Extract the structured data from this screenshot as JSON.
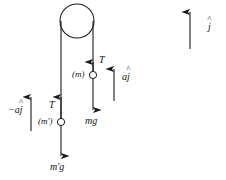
{
  "diagram": {
    "stroke_color": "#1a1a1a",
    "text_color": "#111111",
    "background": "#ffffff",
    "pulley": {
      "name": "pulley-wheel",
      "cx": 77,
      "cy": 21,
      "r": 17
    },
    "ropes": [
      {
        "name": "left-rope",
        "x": 61,
        "y_top": 21,
        "y_bottom": 122
      },
      {
        "name": "right-rope",
        "x": 93,
        "y_top": 21,
        "y_bottom": 75
      }
    ],
    "masses": [
      {
        "name": "mass-node-m-prime",
        "label": "(m')",
        "cx": 61,
        "cy": 122,
        "r": 4
      },
      {
        "name": "mass-node-m",
        "label": "(m)",
        "cx": 93,
        "cy": 75,
        "r": 4
      }
    ],
    "vectors": [
      {
        "name": "tension-left",
        "label": "T",
        "direction": "up",
        "x": 61,
        "y_tail": 122,
        "y_head": 96
      },
      {
        "name": "weight-left",
        "label": "m'g",
        "direction": "down",
        "x": 61,
        "y_tail": 126,
        "y_head": 157
      },
      {
        "name": "tension-right",
        "label": "T",
        "direction": "up",
        "x": 93,
        "y_tail": 75,
        "y_head": 61
      },
      {
        "name": "weight-right",
        "label": "mg",
        "direction": "down",
        "x": 93,
        "y_tail": 79,
        "y_head": 111
      },
      {
        "name": "acceleration-left",
        "label_prefix": "−a",
        "label_hat": "j",
        "direction": "up",
        "x": 31,
        "y_tail": 131,
        "y_head": 96
      },
      {
        "name": "acceleration-right",
        "label_prefix": "a",
        "label_hat": "j",
        "direction": "up",
        "x": 114,
        "y_tail": 101,
        "y_head": 68
      },
      {
        "name": "unit-vector-j",
        "label_prefix": "",
        "label_hat": "j",
        "direction": "up",
        "x": 190,
        "y_tail": 49,
        "y_head": 11
      }
    ],
    "labels": {
      "tension_left": "T",
      "tension_right": "T",
      "weight_left": "m'g",
      "weight_right": "mg",
      "mass_left": "(m')",
      "mass_right": "(m)",
      "accel_left_prefix": "−a",
      "accel_left_hat": "j",
      "accel_right_prefix": "a",
      "accel_right_hat": "j",
      "unit_vector_hat": "j"
    }
  }
}
